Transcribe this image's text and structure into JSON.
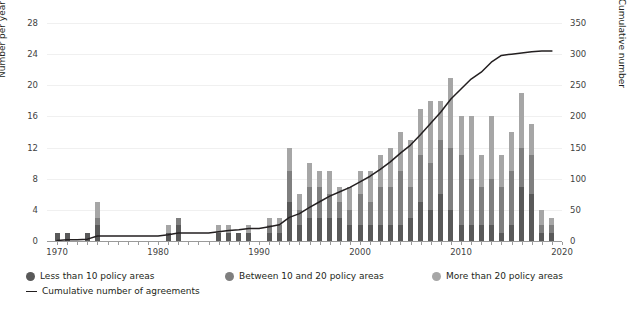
{
  "chart_data": {
    "type": "bar",
    "title": "",
    "subtitle": "",
    "xlabel": "",
    "ylabel": "Number per year",
    "y2label": "Cumulative number",
    "xlim": [
      1969,
      2020
    ],
    "ylim": [
      0,
      28
    ],
    "y2lim": [
      0,
      350
    ],
    "grid": true,
    "legend_position": "bottom-left",
    "stacked": true,
    "x": [
      1970,
      1971,
      1972,
      1973,
      1974,
      1975,
      1976,
      1977,
      1978,
      1979,
      1980,
      1981,
      1982,
      1983,
      1984,
      1985,
      1986,
      1987,
      1988,
      1989,
      1990,
      1991,
      1992,
      1993,
      1994,
      1995,
      1996,
      1997,
      1998,
      1999,
      2000,
      2001,
      2002,
      2003,
      2004,
      2005,
      2006,
      2007,
      2008,
      2009,
      2010,
      2011,
      2012,
      2013,
      2014,
      2015,
      2016,
      2017,
      2018,
      2019
    ],
    "xticks": [
      1970,
      1980,
      1990,
      2000,
      2010,
      2020
    ],
    "yticks": [
      0,
      4,
      8,
      12,
      16,
      20,
      24,
      28
    ],
    "y2ticks": [
      0,
      50,
      100,
      150,
      200,
      250,
      300,
      350
    ],
    "series": [
      {
        "name": "Less than 10 policy areas",
        "color": "#595959",
        "values": [
          1,
          1,
          0,
          1,
          2,
          0,
          0,
          0,
          0,
          0,
          0,
          1,
          2,
          0,
          0,
          0,
          1,
          1,
          1,
          1,
          0,
          1,
          1,
          5,
          2,
          3,
          3,
          3,
          3,
          2,
          2,
          2,
          2,
          2,
          2,
          3,
          5,
          4,
          6,
          4,
          2,
          2,
          2,
          2,
          1,
          2,
          7,
          6,
          1,
          1
        ]
      },
      {
        "name": "Between 10 and 20 policy areas",
        "color": "#7f7f7f",
        "values": [
          0,
          0,
          0,
          0,
          1,
          0,
          0,
          0,
          0,
          0,
          0,
          0,
          1,
          0,
          0,
          0,
          0,
          0,
          0,
          0,
          0,
          1,
          1,
          4,
          2,
          4,
          4,
          3,
          2,
          2,
          4,
          3,
          5,
          5,
          7,
          4,
          6,
          6,
          7,
          8,
          9,
          6,
          5,
          6,
          6,
          7,
          5,
          5,
          1,
          1
        ]
      },
      {
        "name": "More than 20 policy areas",
        "color": "#a6a6a6",
        "values": [
          0,
          0,
          0,
          0,
          2,
          0,
          0,
          0,
          0,
          0,
          0,
          1,
          0,
          0,
          0,
          0,
          1,
          1,
          0,
          1,
          0,
          1,
          1,
          3,
          2,
          3,
          2,
          3,
          2,
          3,
          3,
          4,
          4,
          5,
          5,
          6,
          6,
          8,
          5,
          9,
          5,
          8,
          4,
          8,
          4,
          5,
          7,
          4,
          2,
          1
        ]
      }
    ],
    "totals_per_year": [
      1,
      1,
      0,
      1,
      5,
      0,
      0,
      0,
      0,
      0,
      0,
      2,
      3,
      0,
      0,
      0,
      2,
      2,
      1,
      2,
      0,
      3,
      3,
      12,
      6,
      10,
      9,
      9,
      7,
      7,
      9,
      9,
      11,
      12,
      14,
      13,
      17,
      18,
      18,
      21,
      16,
      16,
      11,
      16,
      11,
      14,
      19,
      15,
      4,
      3
    ],
    "cumulative_line": {
      "name": "Cumulative number of agreements",
      "color": "#231f20",
      "x": [
        1970,
        1971,
        1972,
        1973,
        1974,
        1975,
        1976,
        1977,
        1978,
        1979,
        1980,
        1981,
        1982,
        1983,
        1984,
        1985,
        1986,
        1987,
        1988,
        1989,
        1990,
        1991,
        1992,
        1993,
        1994,
        1995,
        1996,
        1997,
        1998,
        1999,
        2000,
        2001,
        2002,
        2003,
        2004,
        2005,
        2006,
        2007,
        2008,
        2009,
        2010,
        2011,
        2012,
        2013,
        2014,
        2015,
        2016,
        2017,
        2018,
        2019
      ],
      "values": [
        1,
        2,
        2,
        3,
        8,
        8,
        8,
        8,
        8,
        8,
        8,
        10,
        13,
        13,
        13,
        13,
        15,
        17,
        18,
        20,
        20,
        23,
        26,
        38,
        44,
        54,
        63,
        72,
        79,
        86,
        95,
        104,
        115,
        127,
        141,
        154,
        171,
        189,
        207,
        228,
        244,
        260,
        271,
        287,
        298,
        300,
        302,
        304,
        305,
        305
      ]
    }
  },
  "axes": {
    "left_title": "Number per year",
    "right_title": "Cumulative number",
    "left_ticks": [
      "28",
      "24",
      "20",
      "16",
      "12",
      "8",
      "4",
      "0"
    ],
    "right_ticks": [
      "350",
      "300",
      "250",
      "200",
      "150",
      "100",
      "50",
      "0"
    ],
    "x_ticks": [
      "1970",
      "1980",
      "1990",
      "2000",
      "2010",
      "2020"
    ]
  },
  "legend": {
    "items": [
      {
        "label": "Less than 10 policy areas",
        "marker": "circle",
        "color": "#595959"
      },
      {
        "label": "Between 10 and 20 policy areas",
        "marker": "circle",
        "color": "#7f7f7f"
      },
      {
        "label": "More than 20 policy areas",
        "marker": "circle",
        "color": "#a6a6a6"
      },
      {
        "label": "Cumulative number of agreements",
        "marker": "line",
        "color": "#231f20"
      }
    ]
  }
}
